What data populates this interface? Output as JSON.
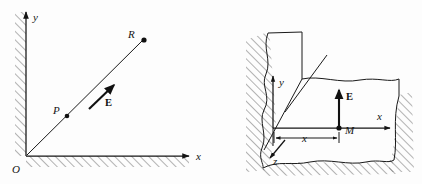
{
  "figure": {
    "background_color": "#fdfdfd",
    "ink_color": "#141414",
    "hatch_color": "#4a4a4a",
    "panels": [
      {
        "id": "left-panel",
        "name": "quarter-plane-field-diagram",
        "description": "Two-dimensional x-y quadrant bounded by hatched walls with points P and R on a ray from origin and field vector E along it",
        "axes": [
          {
            "name": "y-axis",
            "label": "y",
            "direction": "up"
          },
          {
            "name": "x-axis",
            "label": "x",
            "direction": "right"
          }
        ],
        "origin_label": "O",
        "points": [
          {
            "name": "point-P",
            "label": "P"
          },
          {
            "name": "point-R",
            "label": "R"
          }
        ],
        "vectors": [
          {
            "name": "field-vector-E",
            "label": "E",
            "direction": "up-right-45deg"
          }
        ]
      },
      {
        "id": "right-panel",
        "name": "three-dimensional-corner-field-diagram",
        "description": "Perspective view of ground plane meeting a vertical hatched wall, with x, y, z axes, point M on the x-axis at distance x, and field vector E pointing up from M",
        "axes": [
          {
            "name": "y-axis",
            "label": "y",
            "direction": "up"
          },
          {
            "name": "x-axis",
            "label": "x",
            "direction": "right"
          },
          {
            "name": "z-axis",
            "label": "z",
            "direction": "down-left"
          }
        ],
        "points": [
          {
            "name": "point-M",
            "label": "M"
          }
        ],
        "dimensions": [
          {
            "name": "distance-x",
            "label": "x",
            "style": "double-headed-arrow"
          }
        ],
        "vectors": [
          {
            "name": "field-vector-E",
            "label": "E",
            "direction": "up"
          }
        ]
      }
    ]
  },
  "labels": {
    "left": {
      "y_axis": "y",
      "x_axis": "x",
      "origin": "O",
      "point_p": "P",
      "point_r": "R",
      "field_e": "E"
    },
    "right": {
      "y_axis": "y",
      "x_axis": "x",
      "z_axis": "z",
      "point_m": "M",
      "distance_x": "x",
      "field_e": "E"
    }
  }
}
